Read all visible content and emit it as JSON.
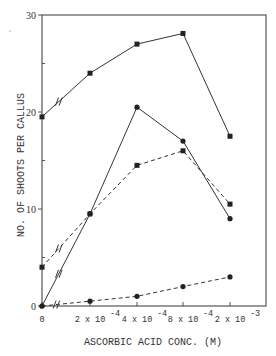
{
  "chart_data": {
    "type": "line",
    "title": "",
    "xlabel": "ASCORBIC ACID CONC. (M)",
    "ylabel": "NO. OF SHOOTS PER CALLUS",
    "categories": [
      "0",
      "2 x 10^-4",
      "4 x 10^-4",
      "8 x 10^-4",
      "2 x 10^-3"
    ],
    "x_tick_labels": [
      {
        "base": "0",
        "exp": ""
      },
      {
        "base": "2 x 10",
        "exp": "-4"
      },
      {
        "base": "4 x 10",
        "exp": "-4"
      },
      {
        "base": "8 x 10",
        "exp": "-4"
      },
      {
        "base": "2 x 10",
        "exp": "-3"
      }
    ],
    "y_ticks": [
      0,
      10,
      20,
      30
    ],
    "y_tick_labels": [
      "0",
      "10",
      "20",
      "30"
    ],
    "ylim": [
      0,
      30
    ],
    "grid": false,
    "legend": "none",
    "axis_break_after_first_category": true,
    "series": [
      {
        "name": "solid-squares",
        "line": "solid",
        "marker": "square",
        "values": [
          19.5,
          24.0,
          27.0,
          28.1,
          17.5
        ]
      },
      {
        "name": "solid-circles",
        "line": "solid",
        "marker": "circle",
        "values": [
          0.0,
          9.5,
          20.5,
          17.0,
          9.0
        ]
      },
      {
        "name": "dashed-squares",
        "line": "dashed",
        "marker": "square",
        "values": [
          4.0,
          9.5,
          14.5,
          16.0,
          10.5
        ]
      },
      {
        "name": "dashed-circles",
        "line": "dashed",
        "marker": "circle",
        "values": [
          0.0,
          0.5,
          1.0,
          2.0,
          3.0
        ]
      }
    ],
    "colors": {
      "line": "#333333",
      "axis": "#555555"
    }
  }
}
